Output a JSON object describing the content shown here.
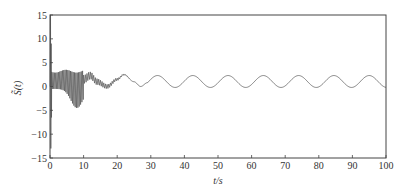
{
  "chart_data": {
    "type": "line",
    "title": "",
    "xlabel": "t/s",
    "ylabel": "S̃(t)",
    "xlim": [
      0,
      100
    ],
    "ylim": [
      -15,
      15
    ],
    "xticks": [
      0,
      10,
      20,
      30,
      40,
      50,
      60,
      70,
      80,
      90,
      100
    ],
    "yticks": [
      15,
      10,
      5,
      0,
      -5,
      -10,
      -15
    ],
    "grid": false,
    "legend": null,
    "line_color": "#555555",
    "series": [
      {
        "name": "S̃(t)",
        "description": "Initial spike near t=0 from about +15 to about -13, dense oscillation 0–10 s with envelope ~+3 to ~-4, noisy decaying oscillation 10–25 s, then steady sinusoid of period ~10.5 s oscillating between about -0.2 and 2.3",
        "initial_spike": {
          "t": 0.3,
          "max": 15,
          "min": -13
        },
        "dense_region": {
          "t_start": 0.5,
          "t_end": 10,
          "upper_envelope": 3.2,
          "lower_envelope_min": -4.5,
          "lower_envelope_min_t": 8
        },
        "transition_points": [
          {
            "t": 10,
            "y": 1.5
          },
          {
            "t": 12,
            "y": 2.3
          },
          {
            "t": 14,
            "y": 1.0
          },
          {
            "t": 17,
            "y": 0.0
          },
          {
            "t": 20,
            "y": 1.5
          },
          {
            "t": 22,
            "y": 2.5
          },
          {
            "t": 25,
            "y": 1.0
          },
          {
            "t": 27,
            "y": 0.0
          },
          {
            "t": 29,
            "y": 0.8
          }
        ],
        "steady_state": {
          "t_start": 29,
          "mean": 1.05,
          "amplitude": 1.25,
          "period": 10.5,
          "first_peak_t": 32
        }
      }
    ]
  },
  "axes": {
    "x_tick_labels": [
      "0",
      "10",
      "20",
      "30",
      "40",
      "50",
      "60",
      "70",
      "80",
      "90",
      "100"
    ],
    "y_tick_labels": [
      "15",
      "10",
      "5",
      "0",
      "−5",
      "−10",
      "−15"
    ],
    "xlabel": "t/s",
    "ylabel": "S̃(t)"
  }
}
